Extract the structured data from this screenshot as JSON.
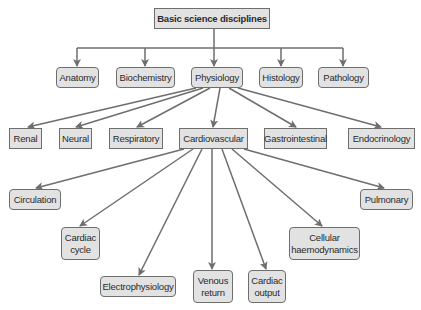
{
  "diagram": {
    "type": "hierarchy",
    "root": {
      "label": "Basic science disciplines"
    },
    "level1": [
      {
        "label": "Anatomy"
      },
      {
        "label": "Biochemistry"
      },
      {
        "label": "Physiology"
      },
      {
        "label": "Histology"
      },
      {
        "label": "Pathology"
      }
    ],
    "level2": [
      {
        "label": "Renal"
      },
      {
        "label": "Neural"
      },
      {
        "label": "Respiratory"
      },
      {
        "label": "Cardiovascular"
      },
      {
        "label": "Gastrointestinal"
      },
      {
        "label": "Endocrinology"
      }
    ],
    "level3": [
      {
        "label": "Circulation"
      },
      {
        "label": "Cardiac\ncycle"
      },
      {
        "label": "Electrophysiology"
      },
      {
        "label": "Venous\nreturn"
      },
      {
        "label": "Cardiac\noutput"
      },
      {
        "label": "Cellular\nhaemodynamics"
      },
      {
        "label": "Pulmonary"
      }
    ],
    "edges": [
      [
        "Basic science disciplines",
        "Anatomy"
      ],
      [
        "Basic science disciplines",
        "Biochemistry"
      ],
      [
        "Basic science disciplines",
        "Physiology"
      ],
      [
        "Basic science disciplines",
        "Histology"
      ],
      [
        "Basic science disciplines",
        "Pathology"
      ],
      [
        "Physiology",
        "Renal"
      ],
      [
        "Physiology",
        "Neural"
      ],
      [
        "Physiology",
        "Respiratory"
      ],
      [
        "Physiology",
        "Cardiovascular"
      ],
      [
        "Physiology",
        "Gastrointestinal"
      ],
      [
        "Physiology",
        "Endocrinology"
      ],
      [
        "Cardiovascular",
        "Circulation"
      ],
      [
        "Cardiovascular",
        "Cardiac cycle"
      ],
      [
        "Cardiovascular",
        "Electrophysiology"
      ],
      [
        "Cardiovascular",
        "Venous return"
      ],
      [
        "Cardiovascular",
        "Cardiac output"
      ],
      [
        "Cardiovascular",
        "Cellular haemodynamics"
      ],
      [
        "Cardiovascular",
        "Pulmonary"
      ]
    ],
    "colors": {
      "box_fill": "#e2e2e2",
      "box_border": "#6e6e6e",
      "line": "#6e6e6e",
      "text": "#2a2a2a"
    }
  }
}
